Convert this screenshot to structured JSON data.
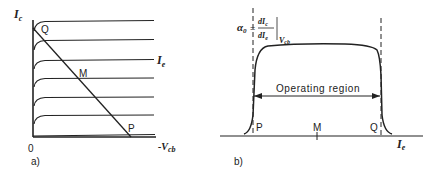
{
  "figure": {
    "panel_a": {
      "caption": "a)",
      "y_axis_label_main": "I",
      "y_axis_label_sub": "c",
      "x_axis_label_prefix": "-V",
      "x_axis_label_sub": "cb",
      "origin_label": "0",
      "curve_family_label_main": "I",
      "curve_family_label_sub": "e",
      "points": {
        "Q": "Q",
        "M": "M",
        "P": "P"
      },
      "curve_levels_y": [
        21,
        40,
        60,
        78,
        97,
        115
      ],
      "load_line": {
        "from": [
          33,
          28
        ],
        "to": [
          130,
          137
        ]
      }
    },
    "panel_b": {
      "caption": "b)",
      "y_label_alpha": "α",
      "y_label_alpha_sub": "0",
      "y_label_eq": "=",
      "y_label_num": "dI",
      "y_label_num_sub": "c",
      "y_label_den": "dI",
      "y_label_den_sub": "e",
      "y_label_eval": "V",
      "y_label_eval_sub": "cb",
      "x_axis_label_main": "I",
      "x_axis_label_sub": "e",
      "region_label": "Operating region",
      "points": {
        "P": "P",
        "M": "M",
        "Q": "Q"
      }
    },
    "colors": {
      "ink": "#222222",
      "background": "#ffffff"
    }
  }
}
